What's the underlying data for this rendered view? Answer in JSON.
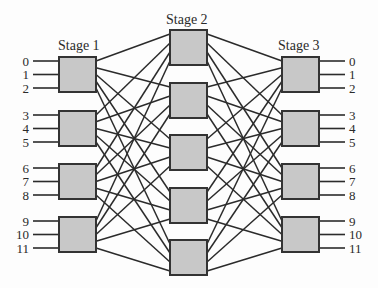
{
  "diagram": {
    "type": "three-stage Clos switching network",
    "stages": [
      {
        "title": "Stage 1",
        "switch_count": 4,
        "ports_per_switch": 3,
        "side": "input"
      },
      {
        "title": "Stage 2",
        "switch_count": 5
      },
      {
        "title": "Stage 3",
        "switch_count": 4,
        "ports_per_switch": 3,
        "side": "output"
      }
    ],
    "input_labels": [
      "0",
      "1",
      "2",
      "3",
      "4",
      "5",
      "6",
      "7",
      "8",
      "9",
      "10",
      "11"
    ],
    "output_labels": [
      "0",
      "1",
      "2",
      "3",
      "4",
      "5",
      "6",
      "7",
      "8",
      "9",
      "10",
      "11"
    ],
    "connectivity": "each Stage 1 switch connects to every Stage 2 switch; each Stage 2 switch connects to every Stage 3 switch",
    "colors": {
      "box_fill": "#c8c8c8",
      "box_stroke": "#333333",
      "line": "#2b2b2b"
    }
  }
}
